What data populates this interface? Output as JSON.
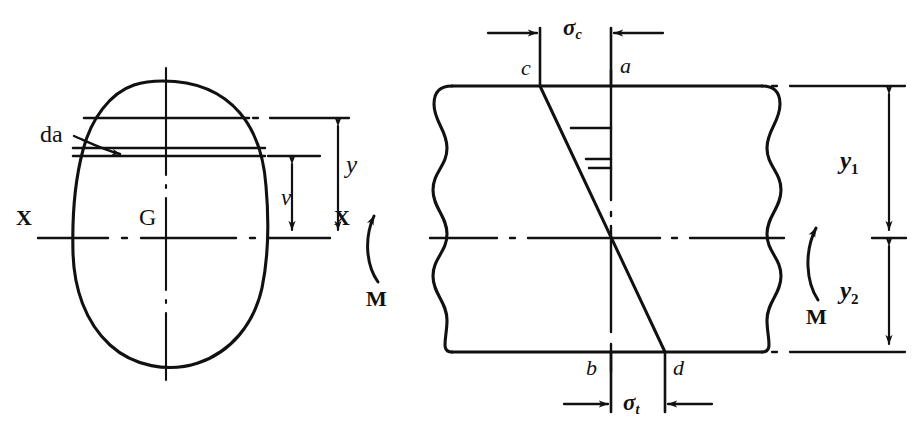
{
  "figure": {
    "background_color": "#ffffff",
    "ink_color": "#111111",
    "width": 913,
    "height": 432
  },
  "left_figure": {
    "name": "cross-section",
    "caption": "Unsymmetrical cross-section with elemental strip",
    "labels": {
      "element_area": "da",
      "centroid": "G",
      "axis_left": "X",
      "axis_right": "X",
      "distance_y": "y",
      "distance_v": "v",
      "moment": "M"
    }
  },
  "right_figure": {
    "name": "beam-elevation",
    "caption": "Beam elevation with linear bending-stress diagram",
    "labels": {
      "compressive_stress": "σ",
      "compressive_stress_sub": "c",
      "tensile_stress": "σ",
      "tensile_stress_sub": "t",
      "point_c": "c",
      "point_a": "a",
      "point_b": "b",
      "point_d": "d",
      "dim_y1": "y",
      "dim_y1_sub": "1",
      "dim_y2": "y",
      "dim_y2_sub": "2",
      "moment": "M"
    }
  },
  "geometry": {
    "neutral_axis_y": 238,
    "beam_top_y": 86,
    "beam_bottom_y": 352,
    "line_c_x": 540,
    "line_a_x": 611,
    "line_d_x": 665,
    "dim_line_x": 889,
    "strip_top_y": 118,
    "strip_lower_upper_y": 148,
    "strip_lower_lower_y": 156
  }
}
